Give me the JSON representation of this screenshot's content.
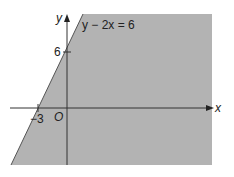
{
  "diagram": {
    "equation": "y − 2x = 6",
    "x_axis_label": "x",
    "y_axis_label": "y",
    "origin_label": "O",
    "y_intercept_label": "6",
    "x_intercept_label": "−3",
    "colors": {
      "shade": "#b3b3b3",
      "axis": "#333333",
      "background": "#ffffff"
    }
  }
}
